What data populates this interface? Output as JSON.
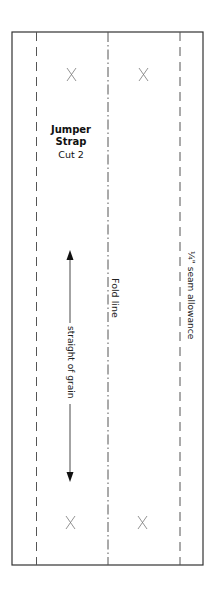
{
  "pattern": {
    "title_line1": "Jumper",
    "title_line2": "Strap",
    "cut": "Cut 2",
    "fold_line": "Fold line",
    "seam_allowance": "¼\" seam allowance",
    "grainline": "straight of grain",
    "marks": "X"
  }
}
